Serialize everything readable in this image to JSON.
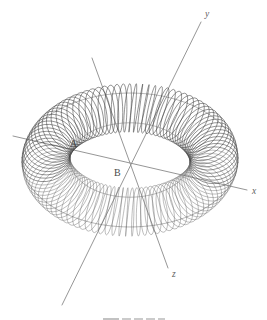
{
  "figure": {
    "kind": "line-drawing",
    "subject": "toroidal-coil-with-coordinate-axes",
    "background_color": "#ffffff",
    "line_color": "#3c3c3c",
    "axis_color": "#8a8a8a",
    "label_color": "#4a4a4a"
  },
  "axes": {
    "origin": {
      "x": 133,
      "y": 164
    },
    "items": [
      {
        "name": "x-axis",
        "label": "x",
        "label_x": 252,
        "label_y": 194,
        "x1": 13,
        "y1": 136,
        "x2": 247,
        "y2": 190
      },
      {
        "name": "y-axis",
        "label": "y",
        "label_x": 205,
        "label_y": 17,
        "x1": 62,
        "y1": 305,
        "x2": 201,
        "y2": 22
      },
      {
        "name": "z-axis",
        "label": "z",
        "label_x": 172,
        "label_y": 277,
        "x1": 92,
        "y1": 58,
        "x2": 168,
        "y2": 268
      }
    ]
  },
  "point_labels": [
    {
      "name": "label-a",
      "text": "A",
      "x": 70,
      "y": 147
    },
    {
      "name": "label-b",
      "text": "B",
      "x": 114,
      "y": 176
    }
  ],
  "pointers": [
    {
      "name": "pointer-to-a",
      "x1": 92,
      "y1": 58,
      "x2": 133,
      "y2": 164
    },
    {
      "name": "pointer-to-b",
      "x1": 62,
      "y1": 305,
      "x2": 133,
      "y2": 164
    }
  ],
  "torus": {
    "center_x": 130,
    "center_y": 160,
    "major_radius_x": 84,
    "major_radius_y": 86,
    "minor_radius": 24,
    "winding_turns": 96,
    "tilt_degrees": -28,
    "squash_y": 0.62
  },
  "caption": {
    "text": "",
    "visible": false,
    "note_segments": 5
  }
}
